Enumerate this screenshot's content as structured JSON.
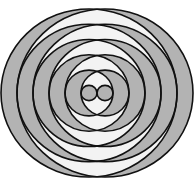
{
  "diagram": {
    "canvas": {
      "width": 194,
      "height": 185
    },
    "center": {
      "x": 97,
      "y": 93
    },
    "vertical_scale": 0.955,
    "offset_d": 8,
    "families": [
      {
        "name": "left",
        "cx": 89,
        "radii": [
          8,
          24,
          40,
          56,
          72,
          88
        ]
      },
      {
        "name": "right",
        "cx": 105,
        "radii": [
          8,
          24,
          40,
          56,
          72,
          88
        ]
      }
    ],
    "shading_rule": "even-odd",
    "colors": {
      "odd_fill": "#b3b3b3",
      "even_fill": "#f3f3f3",
      "stroke": "#111111",
      "background": "#ffffff"
    },
    "stroke_width": 1.6
  }
}
